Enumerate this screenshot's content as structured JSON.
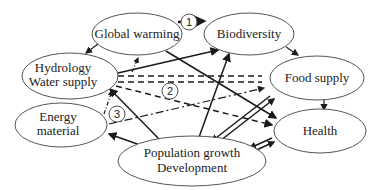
{
  "diagram": {
    "nodes": [
      {
        "id": "global_warming",
        "lines": [
          "Global warming"
        ]
      },
      {
        "id": "biodiversity",
        "lines": [
          "Biodiversity"
        ]
      },
      {
        "id": "hydrology",
        "lines": [
          "Hydrology",
          "Water supply"
        ]
      },
      {
        "id": "food_supply",
        "lines": [
          "Food supply"
        ]
      },
      {
        "id": "energy",
        "lines": [
          "Energy",
          "material"
        ]
      },
      {
        "id": "health",
        "lines": [
          "Health"
        ]
      },
      {
        "id": "population",
        "lines": [
          "Population growth",
          "Development"
        ]
      }
    ],
    "markers": [
      "1",
      "2",
      "3"
    ],
    "colors": {
      "line": "#1a1a1a",
      "ellipse_stroke": "#555555",
      "background": "#ffffff"
    }
  }
}
